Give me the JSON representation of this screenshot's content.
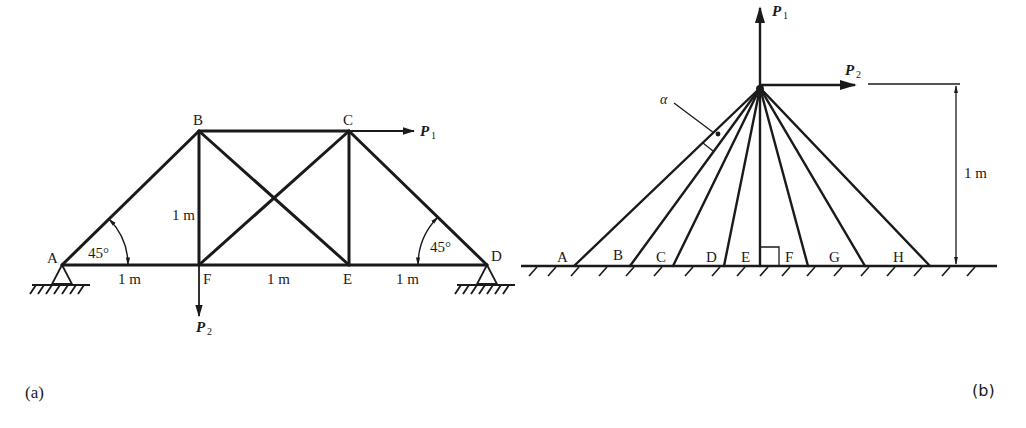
{
  "figure_a": {
    "caption": "(a)",
    "nodes": {
      "A": "A",
      "B": "B",
      "C": "C",
      "D": "D",
      "E": "E",
      "F": "F"
    },
    "forces": {
      "P1": {
        "symbol": "P",
        "sub": "1"
      },
      "P2": {
        "symbol": "P",
        "sub": "2"
      }
    },
    "dimensions": {
      "AF": "1 m",
      "FE": "1 m",
      "ED": "1 m",
      "BF": "1 m"
    },
    "angles": {
      "left": "45°",
      "right": "45°"
    }
  },
  "figure_b": {
    "caption": "(b)",
    "nodes": [
      "A",
      "B",
      "C",
      "D",
      "E",
      "F",
      "G",
      "H"
    ],
    "forces": {
      "P1": {
        "symbol": "P",
        "sub": "1"
      },
      "P2": {
        "symbol": "P",
        "sub": "2"
      }
    },
    "angle_label": "α",
    "height_dimension": "1 m"
  },
  "colors": {
    "ink": "#1a1a1a",
    "background": "#ffffff"
  }
}
